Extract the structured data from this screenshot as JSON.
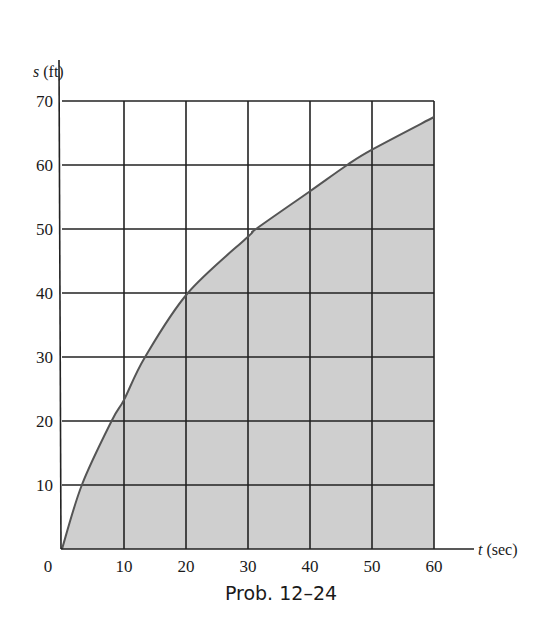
{
  "chart_data": {
    "type": "area",
    "title": "",
    "caption": "Prob. 12–24",
    "xlabel": "t (sec)",
    "xlabel_var": "t",
    "xlabel_unit": "(sec)",
    "ylabel": "s (ft)",
    "ylabel_var": "s",
    "ylabel_unit": "(ft)",
    "xlim": [
      0,
      60
    ],
    "ylim": [
      0,
      70
    ],
    "x_ticks": [
      0,
      10,
      20,
      30,
      40,
      50,
      60
    ],
    "y_ticks": [
      10,
      20,
      30,
      40,
      50,
      60,
      70
    ],
    "grid": true,
    "series": [
      {
        "name": "s(t)",
        "x": [
          0,
          3.2,
          8,
          10,
          13.4,
          20.3,
          30,
          31.3,
          40,
          46,
          50,
          60
        ],
        "y": [
          0,
          10,
          20,
          23.3,
          30,
          40,
          48.8,
          50,
          55.9,
          60,
          62.4,
          67.5
        ]
      }
    ],
    "fill_under_curve": true
  },
  "colors": {
    "fill": "#cfcfcf",
    "grid": "#222222",
    "curve": "#555555",
    "text": "#1a1a1a"
  }
}
